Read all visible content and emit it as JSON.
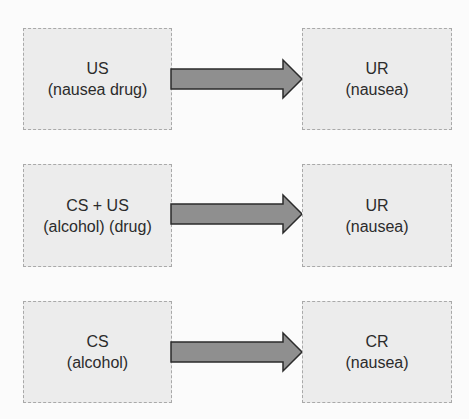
{
  "diagram": {
    "colors": {
      "box_fill": "#ececec",
      "box_border": "#a9a9a9",
      "arrow_fill": "#8f8f8f",
      "arrow_stroke": "#2b2b2b",
      "text": "#2b2b2b"
    },
    "rows": [
      {
        "left": {
          "line1": "US",
          "line2": "(nausea drug)"
        },
        "right": {
          "line1": "UR",
          "line2": "(nausea)"
        }
      },
      {
        "left": {
          "line1": "CS + US",
          "line2": "(alcohol) (drug)"
        },
        "right": {
          "line1": "UR",
          "line2": "(nausea)"
        }
      },
      {
        "left": {
          "line1": "CS",
          "line2": "(alcohol)"
        },
        "right": {
          "line1": "CR",
          "line2": "(nausea)"
        }
      }
    ]
  }
}
